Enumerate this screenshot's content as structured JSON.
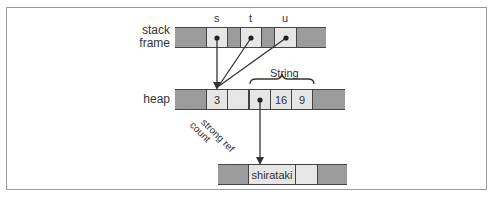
{
  "labels": {
    "stack_frame": "stack\nframe",
    "stack_line1": "stack",
    "stack_line2": "frame",
    "heap": "heap",
    "string_brace": "String",
    "strong_ref_count": "strong ref\ncount",
    "strong_ref_line1": "strong ref",
    "strong_ref_line2": "count"
  },
  "stack_vars": [
    "s",
    "t",
    "u"
  ],
  "heap_cells": {
    "ref_count": "3",
    "capacity": "16",
    "length": "9"
  },
  "buffer_text": "shirataki",
  "colors": {
    "dark_cell": "#9b9b9b",
    "light_cell": "#e6e6e6",
    "line": "#333333"
  }
}
